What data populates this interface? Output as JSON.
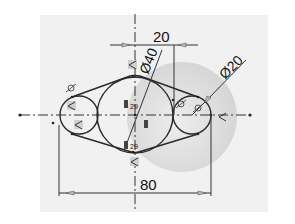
{
  "diagram": {
    "type": "cad-sketch",
    "colors": {
      "background": "#ffffff",
      "sheet": "#f1f1f1",
      "geometry": "#2a2a2a",
      "centerline": "#333333",
      "shading": "#d4d4d4",
      "relation_icon": "#9a9a9a"
    },
    "dimensions": {
      "top_horizontal": "20",
      "bottom_horizontal": "80",
      "large_diameter": "Ø40",
      "small_diameter": "Ø20"
    },
    "relations": {
      "upper_mid_label": "29",
      "lower_mid_label": "29"
    },
    "relation_icons": [
      "tangent-icon",
      "coincident-icon",
      "horizontal-icon",
      "equal-icon"
    ]
  }
}
